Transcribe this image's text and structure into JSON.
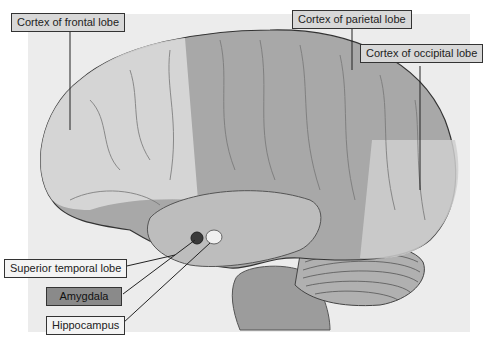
{
  "diagram": {
    "labels": [
      {
        "id": "frontal",
        "text": "Cortex of frontal lobe"
      },
      {
        "id": "parietal",
        "text": "Cortex of parietal lobe"
      },
      {
        "id": "occipital",
        "text": "Cortex of occipital lobe"
      },
      {
        "id": "temporal",
        "text": "Superior temporal lobe"
      },
      {
        "id": "amygdala",
        "text": "Amygdala"
      },
      {
        "id": "hippocampus",
        "text": "Hippocampus"
      }
    ],
    "colors": {
      "background_panel": "#ececec",
      "frontal_region": "#d9d9d9",
      "parietal_region": "#a8a8a8",
      "occipital_region": "#cfcfcf",
      "temporal_region": "#bdbdbd",
      "cerebellum": "#b0b0b0",
      "brainstem": "#9c9c9c",
      "amygdala_fill": "#3a3a3a",
      "hippocampus_fill": "#f0f0f0",
      "outline": "#333333"
    }
  }
}
